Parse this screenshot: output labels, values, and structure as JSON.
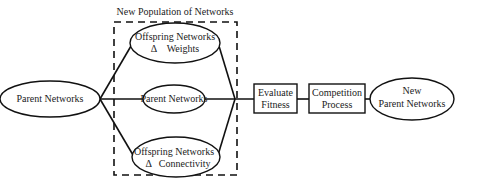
{
  "title": "New Population of Networks",
  "nodes": {
    "parent": {
      "label": "Parent Networks"
    },
    "offspring_weights": {
      "line1": "Offspring Networks",
      "line2": "Δ    Weights"
    },
    "parent_copy": {
      "label": "Parent Networks"
    },
    "offspring_connectivity": {
      "line1": "Offspring Networks",
      "line2": "Δ   Connectivity"
    },
    "evaluate": {
      "line1": "Evaluate",
      "line2": "Fitness"
    },
    "competition": {
      "line1": "Competition",
      "line2": "Process"
    },
    "new_parent": {
      "line1": "New",
      "line2": "Parent Networks"
    }
  },
  "colors": {
    "stroke": "#111111",
    "text": "#222222",
    "background": "#ffffff"
  }
}
